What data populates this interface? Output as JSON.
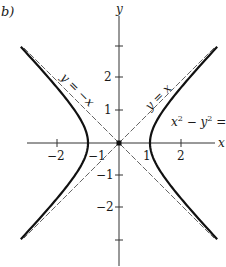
{
  "figure": {
    "panel_label": "b)",
    "axes": {
      "x_label": "x",
      "y_label": "y",
      "x_ticks": [
        {
          "value": -2,
          "label": "−2"
        },
        {
          "value": -1,
          "label": "−1"
        },
        {
          "value": 1,
          "label": "1"
        },
        {
          "value": 2,
          "label": "2"
        }
      ],
      "y_ticks": [
        {
          "value": 3,
          "label": ""
        },
        {
          "value": 2,
          "label": "2"
        },
        {
          "value": 1,
          "label": "1"
        },
        {
          "value": -1,
          "label": "−1"
        },
        {
          "value": -2,
          "label": "−2"
        },
        {
          "value": -3,
          "label": ""
        }
      ]
    },
    "asymptotes": [
      {
        "label": "y = x",
        "equation": "y = x"
      },
      {
        "label": "y = −x",
        "equation": "y = -x"
      }
    ],
    "curve": {
      "label_base": "x",
      "label_exp1": "2",
      "label_mid": " − y",
      "label_exp2": "2",
      "label_tail": " = 1",
      "equation": "x^2 - y^2 = 1"
    },
    "colors": {
      "axis": "#333333",
      "curve": "#111111",
      "asymptote": "#555555"
    }
  }
}
